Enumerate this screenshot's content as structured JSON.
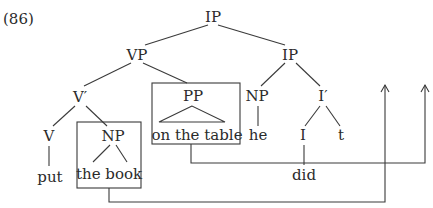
{
  "example_number": "(86)",
  "nodes": {
    "ip_root": "IP",
    "vp": "VP",
    "ip_inner": "IP",
    "v_bar": "V′",
    "pp": "PP",
    "np_subject": "NP",
    "i_bar": "I′",
    "v": "V",
    "np_object": "NP",
    "i": "I",
    "trace": "t"
  },
  "leaves": {
    "put": "put",
    "the_book": "the book",
    "on_the_table": "on the table",
    "he": "he",
    "did": "did"
  },
  "boxes": [
    "PP",
    "NP (the book)"
  ],
  "movement_arrows": [
    {
      "from": "PP box",
      "to": "right edge, up-arrow at x≈426"
    },
    {
      "from": "NP box",
      "to": "up-arrow at x≈385"
    }
  ],
  "colors": {
    "ink": "#2b2b2b",
    "background": "#ffffff"
  }
}
